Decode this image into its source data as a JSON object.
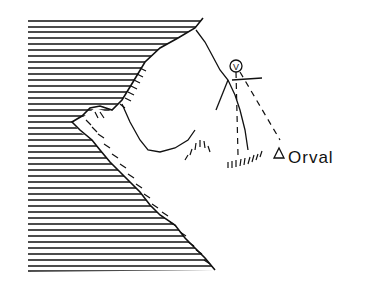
{
  "map": {
    "type": "hand-drawn sketch map",
    "labels": {
      "place": "Orval",
      "viewpoint_symbol": "V"
    },
    "features": [
      "sea (hatched water)",
      "coastline with cliffs",
      "peninsula",
      "river",
      "hachured ridge",
      "viewpoint circle",
      "dashed sight lines",
      "triangle marker"
    ]
  }
}
